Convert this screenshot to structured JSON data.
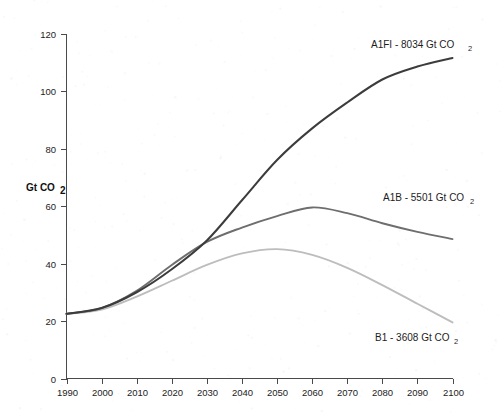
{
  "chart_data": {
    "type": "line",
    "title": "",
    "xlabel": "",
    "ylabel": "Gt CO",
    "ylabel_sub": "2",
    "xlim": [
      1990,
      2100
    ],
    "ylim": [
      0,
      120
    ],
    "grid": false,
    "legend_position": "inline-annotations",
    "x": [
      1990,
      2000,
      2010,
      2020,
      2030,
      2040,
      2050,
      2060,
      2070,
      2080,
      2090,
      2100
    ],
    "xticks": [
      "1990",
      "2000",
      "2010",
      "2020",
      "2030",
      "2040",
      "2050",
      "2060",
      "2070",
      "2080",
      "2090",
      "2100"
    ],
    "yticks": [
      "0",
      "20",
      "40",
      "60",
      "80",
      "100",
      "120"
    ],
    "series": [
      {
        "name": "A1FI",
        "label": "A1FI - 8034 Gt CO",
        "label_sub": "2",
        "cumulative_gt_co2": 8034,
        "color": "#3c3c3c",
        "values": [
          22.5,
          24.5,
          30.0,
          38.0,
          48.0,
          62.0,
          76.0,
          87.0,
          96.0,
          104.0,
          108.5,
          111.5
        ]
      },
      {
        "name": "A1B",
        "label": "A1B - 5501 Gt CO",
        "label_sub": "2",
        "cumulative_gt_co2": 5501,
        "color": "#6e6e6e",
        "values": [
          22.5,
          24.5,
          30.5,
          39.5,
          47.5,
          52.5,
          56.5,
          59.5,
          57.5,
          54.0,
          51.0,
          48.5
        ]
      },
      {
        "name": "B1",
        "label": "B1 - 3608 Gt CO",
        "label_sub": "2",
        "cumulative_gt_co2": 3608,
        "color": "#bdbdbd",
        "values": [
          22.5,
          24.0,
          28.5,
          34.0,
          39.5,
          43.5,
          45.0,
          43.0,
          38.5,
          32.5,
          26.0,
          19.5
        ]
      }
    ]
  },
  "axis": {
    "y_title": "Gt CO",
    "y_title_sub": "2"
  }
}
